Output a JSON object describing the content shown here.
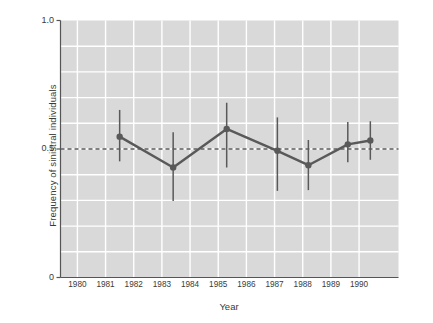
{
  "chart_data": {
    "type": "line",
    "title": "",
    "subtitle": "",
    "xlabel": "Year",
    "ylabel": "Frequency of sinistral individuals",
    "x": [
      1981.5,
      1983.4,
      1985.3,
      1987.1,
      1988.2,
      1989.6,
      1990.4
    ],
    "values": [
      0.548,
      0.428,
      0.578,
      0.493,
      0.437,
      0.518,
      0.533
    ],
    "error_low": [
      0.452,
      0.298,
      0.428,
      0.337,
      0.34,
      0.448,
      0.458
    ],
    "error_high": [
      0.652,
      0.565,
      0.68,
      0.623,
      0.535,
      0.605,
      0.608
    ],
    "series": [
      {
        "name": "Frequency of sinistral individuals",
        "x": [
          1981.5,
          1983.4,
          1985.3,
          1987.1,
          1988.2,
          1989.6,
          1990.4
        ],
        "values": [
          0.548,
          0.428,
          0.578,
          0.493,
          0.437,
          0.518,
          0.533
        ],
        "error_low": [
          0.452,
          0.298,
          0.428,
          0.337,
          0.34,
          0.448,
          0.458
        ],
        "error_high": [
          0.652,
          0.565,
          0.68,
          0.623,
          0.535,
          0.605,
          0.608
        ]
      }
    ],
    "reference_line": {
      "type": "horizontal",
      "value": 0.5,
      "style": "dashed"
    },
    "xlim": [
      1979.4,
      1991.4
    ],
    "ylim": [
      0,
      1.0
    ],
    "xticks": [
      1980,
      1981,
      1982,
      1983,
      1984,
      1985,
      1986,
      1987,
      1988,
      1989,
      1990
    ],
    "xtick_labels": [
      "1980",
      "1981",
      "1982",
      "1983",
      "1984",
      "1985",
      "1986",
      "1987",
      "1988",
      "1989",
      "1990"
    ],
    "yticks": [
      0,
      0.5,
      1.0
    ],
    "ytick_labels": [
      "0",
      "0.5",
      "1.0"
    ],
    "y_gridlines": [
      0.1,
      0.2,
      0.3,
      0.4,
      0.5,
      0.6,
      0.7,
      0.8,
      0.9
    ],
    "x_gridlines": [
      1980,
      1981,
      1982,
      1983,
      1984,
      1985,
      1986,
      1987,
      1988,
      1989,
      1990
    ],
    "grid": true,
    "legend": "none",
    "colors": {
      "plot_background": "#d9d9d9",
      "gridline": "#ffffff",
      "series_line": "#595959",
      "marker": "#595959",
      "errorbar": "#595959",
      "reference_line": "#595959",
      "axis": "#555555",
      "text": "#3a3a3a",
      "page_background": "#ffffff"
    }
  }
}
